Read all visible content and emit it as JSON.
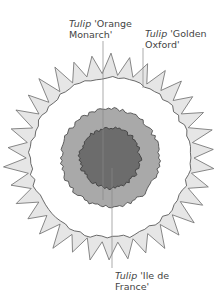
{
  "diagram": {
    "title": "",
    "rings": [
      {
        "id": "outer",
        "variety": "Tulip 'Golden Oxford'",
        "fill": "#e6e6e6",
        "stroke": "#6b6b6b"
      },
      {
        "id": "middle",
        "variety": "Tulip 'Orange Monarch'",
        "fill": "#a9a9a9",
        "stroke": "#505050"
      },
      {
        "id": "center",
        "variety": "Tulip 'Ile de France'",
        "fill": "#6c6c6c",
        "stroke": "#404040"
      }
    ],
    "labels": [
      {
        "genus": "Tulip",
        "cultivar_line1": "'Orange",
        "cultivar_line2": "Monarch'"
      },
      {
        "genus": "Tulip",
        "cultivar_line1": "'Golden",
        "cultivar_line2": "Oxford'"
      },
      {
        "genus": "Tulip",
        "cultivar_line1": "'Ile de",
        "cultivar_line2": "France'"
      }
    ]
  }
}
